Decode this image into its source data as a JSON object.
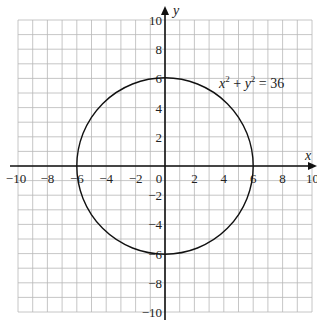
{
  "chart_data": {
    "type": "line",
    "title": "",
    "xlabel": "x",
    "ylabel": "y",
    "xlim": [
      -10,
      10
    ],
    "ylim": [
      -10,
      10
    ],
    "grid": true,
    "grid_step": 1,
    "x_ticks": [
      -10,
      -8,
      -6,
      -4,
      -2,
      0,
      2,
      4,
      6,
      8,
      10
    ],
    "y_ticks": [
      -10,
      -8,
      -6,
      -4,
      -2,
      2,
      4,
      6,
      8,
      10
    ],
    "x_tick_labels": [
      "−10",
      "−8",
      "−6",
      "−4",
      "−2",
      "0",
      "2",
      "4",
      "6",
      "8",
      "10"
    ],
    "y_tick_labels": [
      "−10",
      "−8",
      "−6",
      "−4",
      "−2",
      "2",
      "4",
      "6",
      "8",
      "10"
    ],
    "series": [
      {
        "name": "x² + y² = 36",
        "shape": "circle",
        "center": [
          0,
          0
        ],
        "radius": 6,
        "points": [
          [
            6,
            0
          ],
          [
            0,
            6
          ],
          [
            -6,
            0
          ],
          [
            0,
            -6
          ]
        ]
      }
    ],
    "annotations": [
      {
        "text": "x² + y² = 36",
        "position": [
          5.5,
          5.5
        ]
      }
    ],
    "legend": "none"
  },
  "labels": {
    "x_axis": "x",
    "y_axis": "y",
    "equation_x": "x",
    "equation_y": "y",
    "equation_exp": "2",
    "equation_plus": " + ",
    "equation_rhs": " = 36"
  }
}
